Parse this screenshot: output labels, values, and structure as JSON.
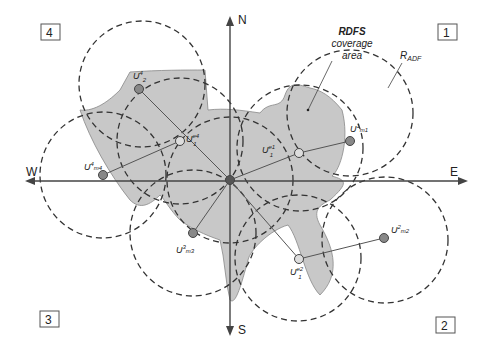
{
  "diagram": {
    "axes": {
      "north": "N",
      "south": "S",
      "west": "W",
      "east": "E"
    },
    "quadrants": [
      {
        "id": "q1",
        "label": "1"
      },
      {
        "id": "q2",
        "label": "2"
      },
      {
        "id": "q3",
        "label": "3"
      },
      {
        "id": "q4",
        "label": "4"
      }
    ],
    "annotations": {
      "coverage_line1": "RDFS",
      "coverage_line2": "coverage",
      "coverage_line3": "area",
      "radius_main": "R",
      "radius_sub": "ADF"
    },
    "nodes": {
      "u4_2": {
        "base": "U",
        "sup": "4",
        "sub": "2"
      },
      "ue4_1": {
        "base": "U",
        "sup": "e4",
        "sub": "1"
      },
      "u4_m4": {
        "base": "U",
        "sup": "4",
        "sub": "m4"
      },
      "ue1_1": {
        "base": "U",
        "sup": "e1",
        "sub": "1"
      },
      "u1_m1": {
        "base": "U",
        "sup": "1",
        "sub": "m1"
      },
      "u3_m3": {
        "base": "U",
        "sup": "3",
        "sub": "m3"
      },
      "ue2_1": {
        "base": "U",
        "sup": "e2",
        "sub": "1"
      },
      "u2_m2": {
        "base": "U",
        "sup": "2",
        "sub": "m2"
      }
    }
  }
}
